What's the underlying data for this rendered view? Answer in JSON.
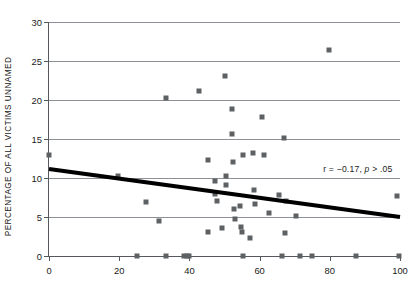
{
  "chart_data": {
    "type": "scatter",
    "title": "",
    "xlabel": "",
    "ylabel": "PERCENTAGE OF ALL VICTIMS UNNAMED",
    "xlim": [
      0,
      100
    ],
    "ylim": [
      0,
      30
    ],
    "xticks": [
      0,
      20,
      40,
      60,
      80,
      100
    ],
    "yticks": [
      0,
      5,
      10,
      15,
      20,
      25,
      30
    ],
    "xtick_labels": [
      "0",
      "20",
      "40",
      "60",
      "80",
      "100"
    ],
    "ytick_labels": [
      "0",
      "5",
      "10",
      "15",
      "20",
      "25",
      "30"
    ],
    "grid": "horizontal",
    "legend": "none",
    "marker": "square",
    "marker_color": "#5e6164",
    "axis_color": "#55585c",
    "grid_color": "#8d9094",
    "trendline_color": "#000000",
    "annotation": {
      "text": "r = −0.17, p > .05",
      "r_part": "r = −0.17, ",
      "p_italic": "p",
      "p_rest": " > .05",
      "x": 88,
      "y": 11.2
    },
    "trendline": {
      "type": "linear",
      "x_start": 0,
      "y_start": 11.15,
      "x_end": 100,
      "y_end": 5.0,
      "width_px": 4.2
    },
    "points": [
      {
        "x": 0.0,
        "y": 13.0
      },
      {
        "x": 19.7,
        "y": 10.25
      },
      {
        "x": 27.5,
        "y": 6.95
      },
      {
        "x": 31.4,
        "y": 4.55
      },
      {
        "x": 33.3,
        "y": 20.25
      },
      {
        "x": 42.6,
        "y": 21.1
      },
      {
        "x": 45.3,
        "y": 12.3
      },
      {
        "x": 45.4,
        "y": 3.05
      },
      {
        "x": 47.2,
        "y": 9.6
      },
      {
        "x": 47.3,
        "y": 7.9
      },
      {
        "x": 48.0,
        "y": 7.05
      },
      {
        "x": 49.4,
        "y": 3.6
      },
      {
        "x": 50.1,
        "y": 23.05
      },
      {
        "x": 50.3,
        "y": 10.2
      },
      {
        "x": 50.5,
        "y": 9.1
      },
      {
        "x": 52.0,
        "y": 18.85
      },
      {
        "x": 52.2,
        "y": 15.7
      },
      {
        "x": 52.4,
        "y": 12.05
      },
      {
        "x": 52.6,
        "y": 6.05
      },
      {
        "x": 53.0,
        "y": 4.8
      },
      {
        "x": 54.5,
        "y": 6.4
      },
      {
        "x": 54.7,
        "y": 3.75
      },
      {
        "x": 54.9,
        "y": 3.05
      },
      {
        "x": 55.4,
        "y": 13.0
      },
      {
        "x": 57.3,
        "y": 2.25
      },
      {
        "x": 58.1,
        "y": 13.2
      },
      {
        "x": 58.4,
        "y": 8.5
      },
      {
        "x": 58.7,
        "y": 6.65
      },
      {
        "x": 60.8,
        "y": 17.85
      },
      {
        "x": 61.3,
        "y": 12.9
      },
      {
        "x": 62.6,
        "y": 5.55
      },
      {
        "x": 65.5,
        "y": 7.85
      },
      {
        "x": 66.9,
        "y": 15.1
      },
      {
        "x": 67.2,
        "y": 2.95
      },
      {
        "x": 67.4,
        "y": 7.1
      },
      {
        "x": 70.3,
        "y": 5.15
      },
      {
        "x": 79.8,
        "y": 26.35
      },
      {
        "x": 99.2,
        "y": 7.75
      },
      {
        "x": 25.0,
        "y": 0.0
      },
      {
        "x": 33.2,
        "y": 0.0
      },
      {
        "x": 38.6,
        "y": 0.0
      },
      {
        "x": 39.4,
        "y": 0.0
      },
      {
        "x": 40.0,
        "y": 0.0
      },
      {
        "x": 55.3,
        "y": 0.0
      },
      {
        "x": 66.4,
        "y": 0.0
      },
      {
        "x": 71.6,
        "y": 0.0
      },
      {
        "x": 74.9,
        "y": 0.0
      },
      {
        "x": 87.4,
        "y": 0.0
      },
      {
        "x": 99.6,
        "y": 0.0
      }
    ]
  }
}
